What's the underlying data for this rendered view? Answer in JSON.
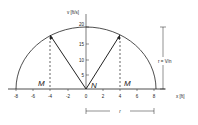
{
  "diagram": {
    "type": "phase-plane semicircle with velocity vectors",
    "x_axis": {
      "label": "x [ft]",
      "ticks": [
        "-8",
        "-6",
        "-4",
        "-2",
        "0",
        "2",
        "4",
        "6",
        "8"
      ]
    },
    "y_axis": {
      "label": "v [ft/s]",
      "ticks": [
        "5",
        "10",
        "15",
        "20"
      ]
    },
    "annotations": {
      "point_left": "M",
      "point_right": "M",
      "origin_point": "N",
      "radius_label": "r",
      "height_label": "r = V/n"
    },
    "colors": {
      "ink": "#222222",
      "background": "#ffffff"
    }
  }
}
